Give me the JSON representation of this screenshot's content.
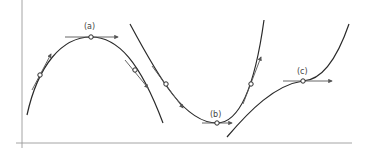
{
  "diagram": {
    "title": "",
    "labels": {
      "a": "(a)",
      "b": "(b)",
      "c": "(c)"
    },
    "points": [
      {
        "id": "a",
        "type": "local-maximum",
        "label": "(a)",
        "x": 91,
        "y": 37
      },
      {
        "id": "b",
        "type": "local-minimum",
        "label": "(b)",
        "x": 217,
        "y": 123
      },
      {
        "id": "c",
        "type": "horizontal-inflection",
        "label": "(c)",
        "x": 303,
        "y": 81
      }
    ],
    "colors": {
      "curve": "#2a2a2a",
      "axis": "#9a9a9a",
      "tangent": "#555555",
      "label": "#444444",
      "background": "#ffffff"
    }
  }
}
